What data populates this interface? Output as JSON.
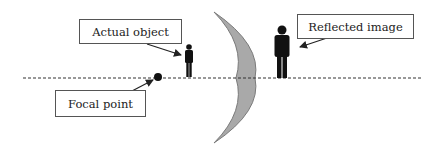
{
  "diagram": {
    "title": "",
    "labels": {
      "actual_object": "Actual object",
      "reflected_image": "Reflected image",
      "focal_point": "Focal point"
    },
    "elements": {
      "mirror": {
        "type": "concave-mirror",
        "fill": "#a9a9a9",
        "stroke": "#7a7a7a"
      },
      "optical_axis": {
        "style": "dashed",
        "color": "#333333"
      },
      "actual_object": {
        "type": "person-silhouette",
        "size": "small",
        "color": "#111111"
      },
      "reflected_image": {
        "type": "person-silhouette",
        "size": "large",
        "upright": true,
        "color": "#111111"
      },
      "focal_point": {
        "type": "dot",
        "color": "#111111"
      }
    }
  }
}
